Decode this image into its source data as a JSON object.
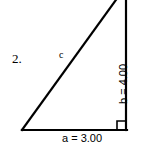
{
  "figure": {
    "item_number": "2.",
    "background_color": "#ffffff",
    "stroke_color": "#000000",
    "labels": {
      "hypotenuse": "c",
      "base": "a = 3.00",
      "vertical": "b = 4.00"
    },
    "right_angle_marker": "right-angle-square",
    "geometry": {
      "type": "right-triangle",
      "leg_a_value": "3.00",
      "leg_b_value": "4.00",
      "hypotenuse_value": "c",
      "right_angle_vertex": "bottom-right",
      "apex_clipped_top": "true"
    }
  }
}
